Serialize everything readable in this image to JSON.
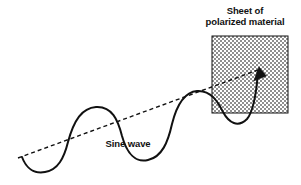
{
  "figure": {
    "width": 301,
    "height": 185,
    "background_color": "#ffffff",
    "ink_color": "#111111"
  },
  "labels": {
    "sheet_line1": "Sheet of",
    "sheet_line2": "polarized material",
    "wave": "Sine wave"
  },
  "diagram": {
    "type": "physics-illustration",
    "sheet": {
      "name": "polarized material sheet",
      "shape": "square",
      "fill": "cross-hatch-checker",
      "fill_color": "#9a9a9a",
      "border_color": "#111111",
      "x": 212,
      "y": 36,
      "width": 76,
      "height": 77,
      "checker_cell_px": 2
    },
    "axis_line": {
      "name": "propagation axis",
      "style": "dashed",
      "color": "#111111",
      "x1": 18,
      "y1": 158,
      "x2": 258,
      "y2": 70,
      "dash_pattern": "4 3"
    },
    "sine_wave": {
      "name": "sine wave",
      "style": "solid",
      "color": "#111111",
      "stroke_width": 2,
      "start": [
        22,
        157
      ],
      "end": [
        258,
        70
      ],
      "cycles": 2,
      "path": "M 22 157 C 26 168 34 174 45 172 C 58 170 64 158 68 142 C 74 120 82 108 96 107 C 112 106 118 120 122 136 C 127 154 136 163 148 160 C 162 157 168 142 172 124 C 177 104 185 92 197 91 C 211 90 218 102 223 112 C 229 123 238 128 247 119 C 253 112 256 98 258 72"
    },
    "arrow_head": {
      "name": "wave arrowhead",
      "color": "#111111",
      "tip": [
        259,
        68
      ],
      "direction_deg": -70
    }
  },
  "colors": {
    "ink": "#111111",
    "sheet_fill": "#9a9a9a",
    "background": "#ffffff"
  }
}
